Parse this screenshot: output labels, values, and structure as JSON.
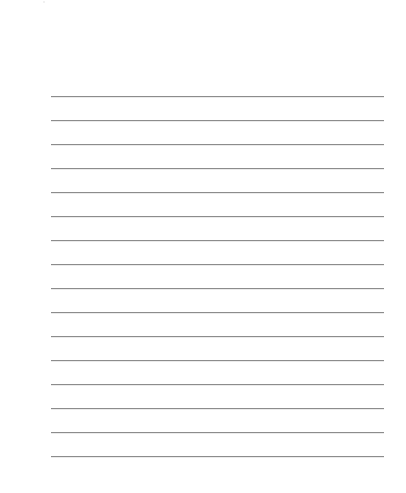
{
  "page": {
    "type": "lined-paper",
    "background_color": "#ffffff",
    "line_color": "#8c8c8c",
    "line_count": 16,
    "lines": [
      {
        "y": 96
      },
      {
        "y": 120
      },
      {
        "y": 144
      },
      {
        "y": 168
      },
      {
        "y": 192
      },
      {
        "y": 216
      },
      {
        "y": 240
      },
      {
        "y": 264
      },
      {
        "y": 288
      },
      {
        "y": 312
      },
      {
        "y": 336
      },
      {
        "y": 360
      },
      {
        "y": 384
      },
      {
        "y": 408
      },
      {
        "y": 432
      },
      {
        "y": 456
      }
    ]
  }
}
